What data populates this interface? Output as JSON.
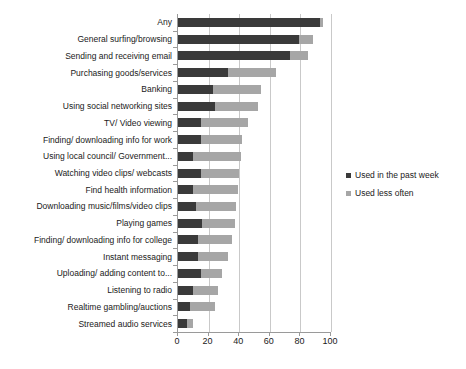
{
  "chart_data": {
    "type": "bar",
    "orientation": "horizontal",
    "stacked": true,
    "title": "",
    "xlabel": "",
    "ylabel": "",
    "xlim": [
      0,
      100
    ],
    "xticks": [
      0,
      20,
      40,
      60,
      80,
      100
    ],
    "grid": true,
    "legend_position": "right",
    "categories": [
      "Any",
      "General surfing/browsing",
      "Sending and receiving email",
      "Purchasing goods/services",
      "Banking",
      "Using social networking sites",
      "TV/ Video viewing",
      "Finding/ downloading info for work",
      "Using local council/ Government...",
      "Watching video clips/ webcasts",
      "Find health information",
      "Downloading music/films/video clips",
      "Playing games",
      "Finding/ downloading info for college",
      "Instant messaging",
      "Uploading/ adding content to...",
      "Listening to radio",
      "Realtime gambling/auctions",
      "Streamed audio services"
    ],
    "series": [
      {
        "name": "Used in the past week",
        "color": "#3a3a3a",
        "values": [
          93,
          79,
          73,
          33,
          23,
          24,
          15,
          15,
          10,
          15,
          10,
          12,
          16,
          13,
          13,
          15,
          10,
          8,
          6
        ]
      },
      {
        "name": "Used less often",
        "color": "#a6a6a6",
        "values": [
          2,
          9,
          12,
          31,
          31,
          28,
          31,
          27,
          31,
          25,
          29,
          26,
          21,
          22,
          20,
          14,
          16,
          16,
          4
        ]
      }
    ],
    "totals": [
      95,
      88,
      85,
      64,
      54,
      52,
      46,
      42,
      41,
      40,
      39,
      38,
      37,
      35,
      33,
      29,
      26,
      24,
      10
    ]
  },
  "legend": {
    "items": [
      {
        "label": "Used in the past week",
        "color": "#3a3a3a"
      },
      {
        "label": "Used less often",
        "color": "#a6a6a6"
      }
    ]
  },
  "axis": {
    "x_tick_labels": [
      "0",
      "20",
      "40",
      "60",
      "80",
      "100"
    ]
  }
}
